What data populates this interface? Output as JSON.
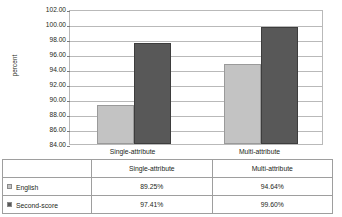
{
  "chart_data": {
    "type": "bar",
    "title": "",
    "xlabel": "",
    "ylabel": "percent",
    "categories": [
      "Single-attribute",
      "Multi-attribute"
    ],
    "series": [
      {
        "name": "English",
        "values": [
          89.25,
          94.64
        ],
        "color": "#c3c3c3"
      },
      {
        "name": "Second-score",
        "values": [
          97.41,
          99.6
        ],
        "color": "#585858"
      }
    ],
    "ylim": [
      84.0,
      102.0
    ],
    "ytick_step": 2.0,
    "ytick_labels": [
      "102.00",
      "100.00",
      "98.00",
      "96.00",
      "94.00",
      "92.00",
      "90.00",
      "88.00",
      "86.00",
      "84.00"
    ],
    "grid": true,
    "legend_position": "table"
  },
  "table": {
    "corner_label": "",
    "column_headers": [
      "Single-attribute",
      "Multi-attribute"
    ],
    "rows": [
      {
        "label": "English",
        "swatch": "legend-swatch-english",
        "values": [
          "89.25%",
          "94.64%"
        ]
      },
      {
        "label": "Second-score",
        "swatch": "legend-swatch-second-score",
        "values": [
          "97.41%",
          "99.60%"
        ]
      }
    ]
  }
}
